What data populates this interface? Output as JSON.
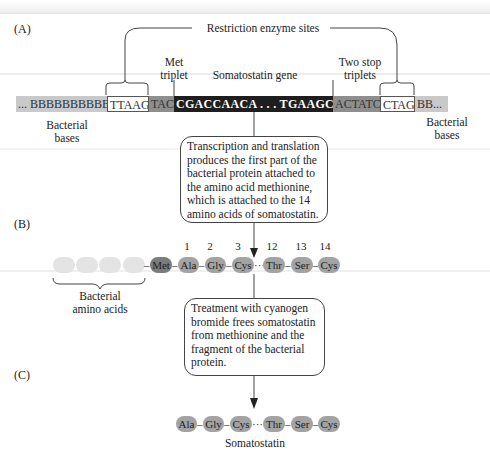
{
  "panels": {
    "a": "(A)",
    "b": "(B)",
    "c": "(C)"
  },
  "panel_a": {
    "restriction_label": "Restriction enzyme sites",
    "met_label_1": "Met",
    "met_label_2": "triplet",
    "gene_label": "Somatostatin gene",
    "stop_label_1": "Two stop",
    "stop_label_2": "triplets",
    "bacterial_left_1": "Bacterial",
    "bacterial_left_2": "bases",
    "bacterial_right_1": "Bacterial",
    "bacterial_right_2": "bases",
    "dna_segments": {
      "bact_left": "... BBBBBBBBBBBBB",
      "site_left": "TTAAG",
      "met": "TAC",
      "gene": "CGACCAACA . . . TGAAGCACA",
      "stop": "ACTATC",
      "site_right": "CTAG",
      "bact_right": "BB..."
    },
    "note": "Transcription and translation produces the first part of the bacterial protein attached to the amino acid methionine, which is attached to the 14 amino acids of somatostatin."
  },
  "panel_b": {
    "positions": [
      "1",
      "2",
      "3",
      "12",
      "13",
      "14"
    ],
    "amino_acids": [
      "Met",
      "Ala",
      "Gly",
      "Cys",
      "Thr",
      "Ser",
      "Cys"
    ],
    "bacterial_label_1": "Bacterial",
    "bacterial_label_2": "amino acids",
    "note": "Treatment with cyanogen bromide frees somatostatin from methionine and the fragment of the bacterial protein."
  },
  "panel_c": {
    "amino_acids": [
      "Ala",
      "Gly",
      "Cys",
      "Thr",
      "Ser",
      "Cys"
    ],
    "label": "Somatostatin"
  }
}
